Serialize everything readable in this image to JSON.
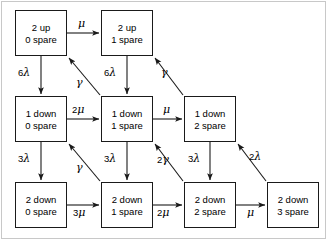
{
  "diagram": {
    "background": "#ffffff",
    "frame_color": "#c8c8c8",
    "box_border_color": "#1a1a1a",
    "arrow_color": "#1a1a1a",
    "states": [
      {
        "id": "s-2up-0spare",
        "line1": "2 up",
        "line2": "0 spare",
        "x": 15,
        "y": 10,
        "w": 52,
        "h": 46
      },
      {
        "id": "s-2up-1spare",
        "line1": "2 up",
        "line2": "1 spare",
        "x": 101,
        "y": 10,
        "w": 52,
        "h": 46
      },
      {
        "id": "s-1down-0spare",
        "line1": "1 down",
        "line2": "0 spare",
        "x": 15,
        "y": 96,
        "w": 52,
        "h": 46
      },
      {
        "id": "s-1down-1spare",
        "line1": "1 down",
        "line2": "1 spare",
        "x": 101,
        "y": 96,
        "w": 52,
        "h": 46
      },
      {
        "id": "s-1down-2spare",
        "line1": "1 down",
        "line2": "2 spare",
        "x": 184,
        "y": 96,
        "w": 52,
        "h": 46
      },
      {
        "id": "s-2down-0spare",
        "line1": "2 down",
        "line2": "0 spare",
        "x": 15,
        "y": 182,
        "w": 52,
        "h": 46
      },
      {
        "id": "s-2down-1spare",
        "line1": "2 down",
        "line2": "1 spare",
        "x": 101,
        "y": 182,
        "w": 52,
        "h": 46
      },
      {
        "id": "s-2down-2spare",
        "line1": "2 down",
        "line2": "2 spare",
        "x": 184,
        "y": 182,
        "w": 52,
        "h": 46
      },
      {
        "id": "s-2down-3spare",
        "line1": "2 down",
        "line2": "3 spare",
        "x": 267,
        "y": 182,
        "w": 52,
        "h": 46
      }
    ],
    "transitions": [
      {
        "id": "t-2up0-to-2up1",
        "label": "μ",
        "coef": "",
        "symbol": "μ",
        "from": "s-2up-0spare",
        "to": "s-2up-1spare",
        "label_x": 78,
        "label_y": 19
      },
      {
        "id": "t-2up0-to-1down0",
        "label": "6λ",
        "coef": "6",
        "symbol": "λ",
        "from": "s-2up-0spare",
        "to": "s-1down-0spare",
        "label_x": 18,
        "label_y": 68
      },
      {
        "id": "t-2up1-to-1down1",
        "label": "6λ",
        "coef": "6",
        "symbol": "λ",
        "from": "s-2up-1spare",
        "to": "s-1down-1spare",
        "label_x": 104,
        "label_y": 68
      },
      {
        "id": "t-1down1-to-2up0",
        "label": "γ",
        "coef": "",
        "symbol": "γ",
        "from": "s-1down-1spare",
        "to": "s-2up-0spare",
        "label_x": 76,
        "label_y": 78
      },
      {
        "id": "t-1down2-to-2up1",
        "label": "γ",
        "coef": "",
        "symbol": "γ",
        "from": "s-1down-2spare",
        "to": "s-2up-1spare",
        "label_x": 161,
        "label_y": 68
      },
      {
        "id": "t-1down0-to-1down1",
        "label": "2μ",
        "coef": "2",
        "symbol": "μ",
        "from": "s-1down-0spare",
        "to": "s-1down-1spare",
        "label_x": 72,
        "label_y": 105
      },
      {
        "id": "t-1down1-to-1down2",
        "label": "μ",
        "coef": "",
        "symbol": "μ",
        "from": "s-1down-1spare",
        "to": "s-1down-2spare",
        "label_x": 163,
        "label_y": 105
      },
      {
        "id": "t-1down0-to-2down0",
        "label": "3λ",
        "coef": "3",
        "symbol": "λ",
        "from": "s-1down-0spare",
        "to": "s-2down-0spare",
        "label_x": 18,
        "label_y": 154
      },
      {
        "id": "t-1down1-to-2down1",
        "label": "3λ",
        "coef": "3",
        "symbol": "λ",
        "from": "s-1down-1spare",
        "to": "s-2down-1spare",
        "label_x": 104,
        "label_y": 154
      },
      {
        "id": "t-1down2-to-2down2",
        "label": "3λ",
        "coef": "3",
        "symbol": "λ",
        "from": "s-1down-2spare",
        "to": "s-2down-2spare",
        "label_x": 188,
        "label_y": 154
      },
      {
        "id": "t-2down1-to-1down0",
        "label": "γ",
        "coef": "",
        "symbol": "γ",
        "from": "s-2down-1spare",
        "to": "s-1down-0spare",
        "label_x": 76,
        "label_y": 163
      },
      {
        "id": "t-2down2-to-1down1",
        "label": "2γ",
        "coef": "2",
        "symbol": "γ",
        "from": "s-2down-2spare",
        "to": "s-1down-1spare",
        "label_x": 157,
        "label_y": 155
      },
      {
        "id": "t-2down3-to-1down2",
        "label": "2λ",
        "coef": "2",
        "symbol": "λ",
        "from": "s-2down-3spare",
        "to": "s-1down-2spare",
        "label_x": 249,
        "label_y": 152
      },
      {
        "id": "t-2down0-to-2down1",
        "label": "3μ",
        "coef": "3",
        "symbol": "μ",
        "from": "s-2down-0spare",
        "to": "s-2down-1spare",
        "label_x": 73,
        "label_y": 208
      },
      {
        "id": "t-2down1-to-2down2",
        "label": "2μ",
        "coef": "2",
        "symbol": "μ",
        "from": "s-2down-1spare",
        "to": "s-2down-2spare",
        "label_x": 157,
        "label_y": 208
      },
      {
        "id": "t-2down2-to-2down3",
        "label": "μ",
        "coef": "",
        "symbol": "μ",
        "from": "s-2down-2spare",
        "to": "s-2down-3spare",
        "label_x": 247,
        "label_y": 208
      }
    ]
  }
}
